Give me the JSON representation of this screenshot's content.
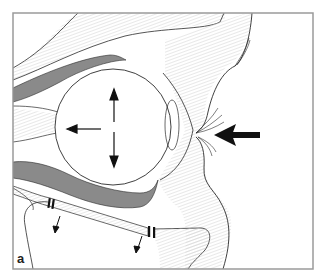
{
  "figure": {
    "panel_label": "a",
    "colors": {
      "frame": "#9a9a9a",
      "outline": "#2a2a2a",
      "muscle_fill": "#8a8a8a",
      "tissue_hatch": "#dedede",
      "arrow": "#111111"
    },
    "arrows": [
      {
        "name": "external-force-arrow",
        "direction": "left",
        "style": "bold"
      },
      {
        "name": "globe-displacement-up",
        "direction": "up"
      },
      {
        "name": "globe-displacement-down",
        "direction": "down"
      },
      {
        "name": "globe-displacement-back",
        "direction": "left"
      },
      {
        "name": "floor-fracture-fragment-1",
        "direction": "down"
      },
      {
        "name": "floor-fracture-fragment-2",
        "direction": "down"
      }
    ]
  }
}
